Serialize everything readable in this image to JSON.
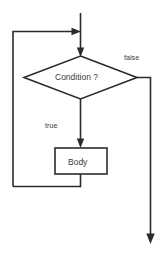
{
  "diagram": {
    "type": "flowchart",
    "background_color": "#ffffff",
    "line_color": "#2b2b2b",
    "text_color": "#3a3a3a",
    "nodes": [
      {
        "id": "condition",
        "shape": "diamond",
        "label": "Condition ?",
        "cx": 80,
        "cy": 77,
        "width": 114,
        "height": 43
      },
      {
        "id": "body",
        "shape": "rectangle",
        "label": "Body",
        "x": 55,
        "y": 148,
        "width": 52,
        "height": 26
      }
    ],
    "edges": [
      {
        "id": "entry",
        "from": "start",
        "to": "condition",
        "label": "",
        "arrow": true
      },
      {
        "id": "loop-back",
        "from": "body",
        "to": "condition",
        "label": "",
        "arrow": true
      },
      {
        "id": "true-branch",
        "from": "condition",
        "to": "body",
        "label": "true",
        "arrow": true
      },
      {
        "id": "false-branch",
        "from": "condition",
        "to": "exit",
        "label": "false",
        "arrow": true
      }
    ],
    "labels": {
      "condition": "Condition ?",
      "body": "Body",
      "true_branch": "true",
      "false_branch": "false"
    }
  }
}
